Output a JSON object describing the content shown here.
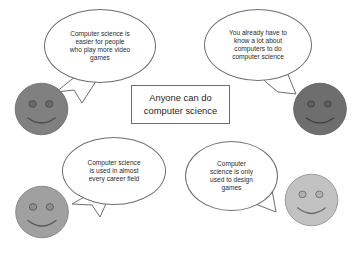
{
  "diagram": {
    "title_box": {
      "text": "Anyone can do\ncomputer science"
    },
    "bubbles": [
      {
        "id": "video-games",
        "text": "Computer science is\neasier for people\nwho play more video\ngames",
        "speaker": "face-top-left"
      },
      {
        "id": "know-a-lot",
        "text": "You already have to\nknow a lot about\ncomputers to do\ncomputer science",
        "speaker": "face-top-right"
      },
      {
        "id": "career-field",
        "text": "Computer science\nis used in almost\nevery career field",
        "speaker": "face-bottom-left"
      },
      {
        "id": "design-games",
        "text": "Computer\nscience is only\nused to design\ngames",
        "speaker": "face-bottom-right"
      }
    ],
    "faces": [
      {
        "id": "top-left",
        "fill": "#808080",
        "stroke": "#6b6b6b",
        "feature": "#4a4a4a"
      },
      {
        "id": "top-right",
        "fill": "#6e6e6e",
        "stroke": "#5c5c5c",
        "feature": "#3f3f3f"
      },
      {
        "id": "bottom-left",
        "fill": "#a0a0a0",
        "stroke": "#7d7d7d",
        "feature": "#5a5a5a"
      },
      {
        "id": "bottom-right",
        "fill": "#c2c2c2",
        "stroke": "#8e8e8e",
        "feature": "#6e6e6e"
      }
    ],
    "colors": {
      "background": "#ffffff",
      "outline": "#6e6e6e",
      "text": "#2b2b2b"
    }
  }
}
